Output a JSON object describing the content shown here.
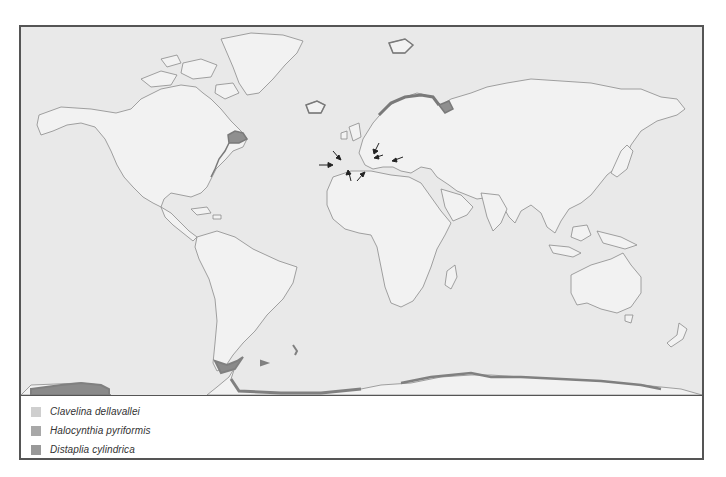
{
  "map": {
    "type": "world distribution map",
    "background_color": "#e9e9e9",
    "land_color": "#f2f2f2",
    "coast_color": "#8a8a8a",
    "arrows": [
      {
        "region": "Strait of Gibraltar",
        "direction": "east"
      },
      {
        "region": "Balearic / Spain coast",
        "direction": "southeast"
      },
      {
        "region": "Algeria coast",
        "direction": "north"
      },
      {
        "region": "Tunisia coast",
        "direction": "northeast"
      },
      {
        "region": "Adriatic Sea",
        "direction": "southwest"
      },
      {
        "region": "Adriatic / Italy heel",
        "direction": "west"
      },
      {
        "region": "Aegean Sea",
        "direction": "west"
      }
    ],
    "shaded_regions": [
      {
        "region": "Gulf of Maine / Nova Scotia",
        "species": "Halocynthia pyriformis"
      },
      {
        "region": "US Northeast coast",
        "species": "Halocynthia pyriformis"
      },
      {
        "region": "Iceland",
        "species": "Halocynthia pyriformis"
      },
      {
        "region": "Svalbard",
        "species": "Halocynthia pyriformis"
      },
      {
        "region": "Norway coast",
        "species": "Halocynthia pyriformis"
      },
      {
        "region": "Kola Peninsula / White Sea",
        "species": "Halocynthia pyriformis"
      },
      {
        "region": "Tierra del Fuego",
        "species": "Distaplia cylindrica"
      },
      {
        "region": "Falkland Islands",
        "species": "Distaplia cylindrica"
      },
      {
        "region": "South Georgia",
        "species": "Distaplia cylindrica"
      },
      {
        "region": "Antarctic Peninsula",
        "species": "Distaplia cylindrica"
      },
      {
        "region": "Antarctica coast",
        "species": "Distaplia cylindrica"
      }
    ]
  },
  "legend": {
    "items": [
      {
        "label": "Clavelina dellavallei",
        "color": "#cfcfcf"
      },
      {
        "label": "Halocynthia pyriformis",
        "color": "#a8a8a8"
      },
      {
        "label": "Distaplia cylindrica",
        "color": "#999999"
      }
    ]
  }
}
